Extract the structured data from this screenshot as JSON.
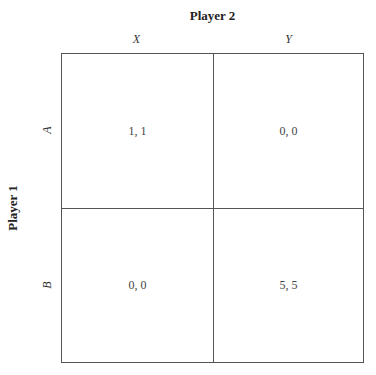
{
  "game": {
    "column_player": "Player 2",
    "row_player": "Player 1",
    "column_strategies": [
      "X",
      "Y"
    ],
    "row_strategies": [
      "A",
      "B"
    ],
    "payoffs": [
      [
        "1, 1",
        "0, 0"
      ],
      [
        "0, 0",
        "5, 5"
      ]
    ]
  },
  "colors": {
    "line": "#555555",
    "text": "#333333",
    "background": "#ffffff"
  }
}
